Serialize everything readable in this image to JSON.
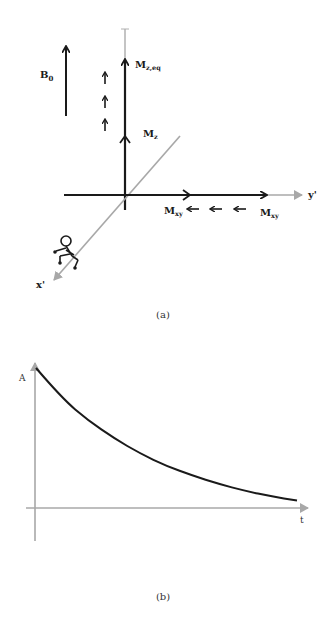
{
  "panel_a": {
    "caption": "(a)",
    "labels": {
      "b0": "B",
      "b0_sub": "0",
      "mz_eq": "M",
      "mz_eq_sub": "z,eq",
      "mz": "M",
      "mz_sub": "z",
      "mxy_left": "M",
      "mxy_left_sub": "xy",
      "mxy_right": "M",
      "mxy_right_sub": "xy",
      "x_axis": "x'",
      "y_axis": "y'"
    },
    "colors": {
      "dark": "#1a1a1a",
      "axis_gray": "#a8a8a8"
    }
  },
  "panel_b": {
    "caption": "(b)",
    "labels": {
      "y_axis": "A",
      "x_axis": "t"
    }
  },
  "chart_data": {
    "type": "line",
    "title": "",
    "xlabel": "t",
    "ylabel": "A",
    "grid": false,
    "x": [
      0,
      0.1,
      0.2,
      0.3,
      0.4,
      0.5,
      0.6,
      0.7,
      0.8,
      0.9,
      1.0
    ],
    "series": [
      {
        "name": "A(t)",
        "values": [
          1.0,
          0.78,
          0.62,
          0.49,
          0.38,
          0.29,
          0.22,
          0.16,
          0.11,
          0.07,
          0.04
        ]
      }
    ],
    "xlim": [
      0,
      1
    ],
    "ylim": [
      0,
      1
    ]
  }
}
